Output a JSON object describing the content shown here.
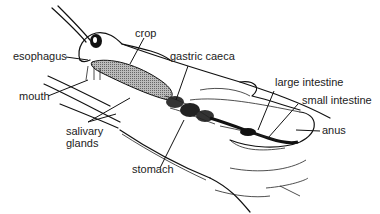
{
  "labels": {
    "esophagus": "esophagus",
    "crop": "crop",
    "gastric_caeca": "gastric caeca",
    "mouth": "mouth",
    "large_intestine": "large intestine",
    "small_intestine": "small intestine",
    "salivary_line1": "salivary",
    "salivary_line2": "glands",
    "stomach": "stomach",
    "anus": "anus"
  }
}
